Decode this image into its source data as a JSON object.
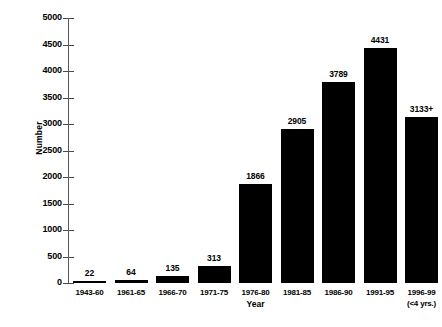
{
  "chart_data": {
    "type": "bar",
    "title": "",
    "xlabel": "Year",
    "ylabel": "Number",
    "categories": [
      "1943-60",
      "1961-65",
      "1966-70",
      "1971-75",
      "1976-80",
      "1981-85",
      "1986-90",
      "1991-95",
      "1996-99"
    ],
    "category_sublabels": [
      "",
      "",
      "",
      "",
      "",
      "",
      "",
      "",
      "(<4 yrs.)"
    ],
    "values": [
      22,
      64,
      135,
      313,
      1866,
      2905,
      3789,
      4431,
      3133
    ],
    "value_labels": [
      "22",
      "64",
      "135",
      "313",
      "1866",
      "2905",
      "3789",
      "4431",
      "3133+"
    ],
    "ylim": [
      0,
      5000
    ],
    "y_ticks": [
      5000,
      4500,
      4000,
      3500,
      3000,
      2500,
      2000,
      1500,
      1000,
      500,
      0
    ],
    "y_tick_labels": [
      "5000",
      "4500",
      "4000",
      "3500",
      "3000",
      "2500",
      "2000",
      "1500",
      "1000",
      "500",
      "0"
    ],
    "grid": false,
    "legend": false,
    "bar_color": "#000000",
    "axis_color": "#585858",
    "background_color": "#ffffff"
  }
}
